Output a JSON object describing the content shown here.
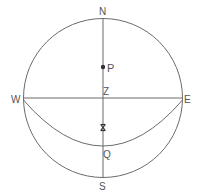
{
  "diagram": {
    "type": "celestial-sphere",
    "colors": {
      "line": "#6b6b6b",
      "text": "#555555",
      "background": "#ffffff"
    },
    "labels": {
      "north": "N",
      "south": "S",
      "west": "W",
      "east": "E",
      "zenith": "Z",
      "pole": "P",
      "q": "Q",
      "x": "X"
    }
  }
}
